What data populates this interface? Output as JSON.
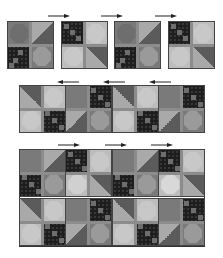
{
  "diagram": {
    "type": "quilt-assembly",
    "colors": {
      "snowball_dark": "#7a7a7a",
      "snowball_light": "#bdbdbd",
      "nine_patch_dark": "#1e1e1e",
      "half_square_light": "#a9a9a9",
      "half_square_dark": "#5b5b5b",
      "sashing": "#8c8c8c",
      "arrow": "#222222"
    },
    "rows": [
      {
        "label": "row-1",
        "blocks": 4,
        "pressing": "right",
        "arrows": 3,
        "layout": "separate-blocks"
      },
      {
        "label": "row-2",
        "blocks": 4,
        "pressing": "left",
        "arrows": 3,
        "layout": "joined-strip"
      },
      {
        "label": "row-3",
        "blocks": 8,
        "pressing": "right",
        "arrows": 3,
        "layout": "joined-two-rows"
      }
    ]
  }
}
